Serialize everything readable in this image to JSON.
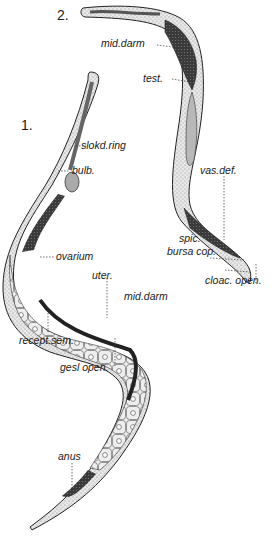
{
  "figure": {
    "specimen_2_number": "2.",
    "specimen_1_number": "1.",
    "specimen_2_labels": {
      "mid_darm": "mid.darm",
      "test": "test.",
      "vas_def": "vas.def.",
      "spic": "spic.",
      "bursa_cop": "bursa cop.",
      "cloac_open": "cloac. open."
    },
    "specimen_1_labels": {
      "slokd_ring": "slokd.ring",
      "bulb": "bulb.",
      "ovarium": "ovarium",
      "uter": "uter.",
      "mid_darm": "mid.darm",
      "recept_sem": "recept.sem.",
      "gesl_open": "gesl open.",
      "anus": "anus"
    }
  }
}
